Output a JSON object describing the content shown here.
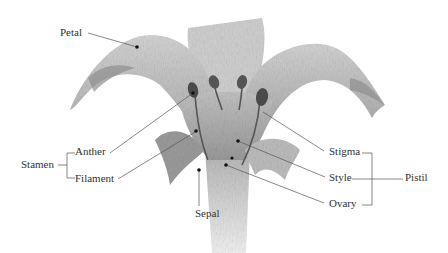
{
  "diagram": {
    "labels": {
      "petal": "Petal",
      "anther": "Anther",
      "filament": "Filament",
      "stamen": "Stamen",
      "stigma": "Stigma",
      "style": "Style",
      "ovary": "Ovary",
      "pistil": "Pistil",
      "sepal": "Sepal"
    },
    "groups": [
      {
        "name": "Stamen",
        "members": [
          "Anther",
          "Filament"
        ]
      },
      {
        "name": "Pistil",
        "members": [
          "Stigma",
          "Style",
          "Ovary"
        ]
      }
    ],
    "colors": {
      "line": "#555555",
      "text": "#333333",
      "petal_fill": "#c8c8c8",
      "petal_dark": "#8a8a8a",
      "anther_fill": "#4a4a4a"
    }
  }
}
